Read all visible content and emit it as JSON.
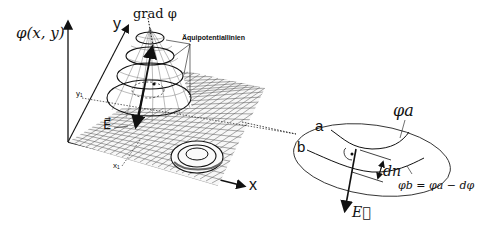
{
  "diagram": {
    "left_panel": {
      "z_axis_label": "φ(x, y)",
      "y_axis_label": "y",
      "x_axis_label": "x",
      "y_tick": "y₁",
      "x_tick": "x₁",
      "gradient_label": "grad φ",
      "equipotential_label": "Äquipotentiallinien",
      "field_label": "E⃗"
    },
    "right_panel": {
      "line_a_label": "a",
      "line_b_label": "b",
      "phi_a_label": "φa",
      "phi_b_label": "φb = φa − dφ",
      "dn_label": "dn",
      "field_label": "E⃗"
    },
    "colors": {
      "ink": "#111111",
      "grid": "#444444",
      "background": "#ffffff"
    }
  }
}
